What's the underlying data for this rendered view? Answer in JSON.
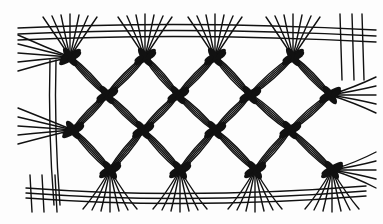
{
  "illustration": {
    "subject": "Macramé square-knot net sampler drawing",
    "style": "black ink line drawing on white",
    "colors": {
      "ink": "#111111",
      "paper": "#fdfdfd"
    },
    "knot_rows": [
      {
        "y": 57,
        "x": [
          70,
          145,
          215,
          293
        ]
      },
      {
        "y": 95,
        "x": [
          107,
          178,
          250,
          330
        ]
      },
      {
        "y": 130,
        "x": [
          73,
          143,
          215,
          290
        ]
      },
      {
        "y": 170,
        "x": [
          110,
          180,
          255,
          332
        ]
      }
    ],
    "bounds": {
      "left": 18,
      "right": 376,
      "top": 14,
      "bottom": 212
    }
  }
}
